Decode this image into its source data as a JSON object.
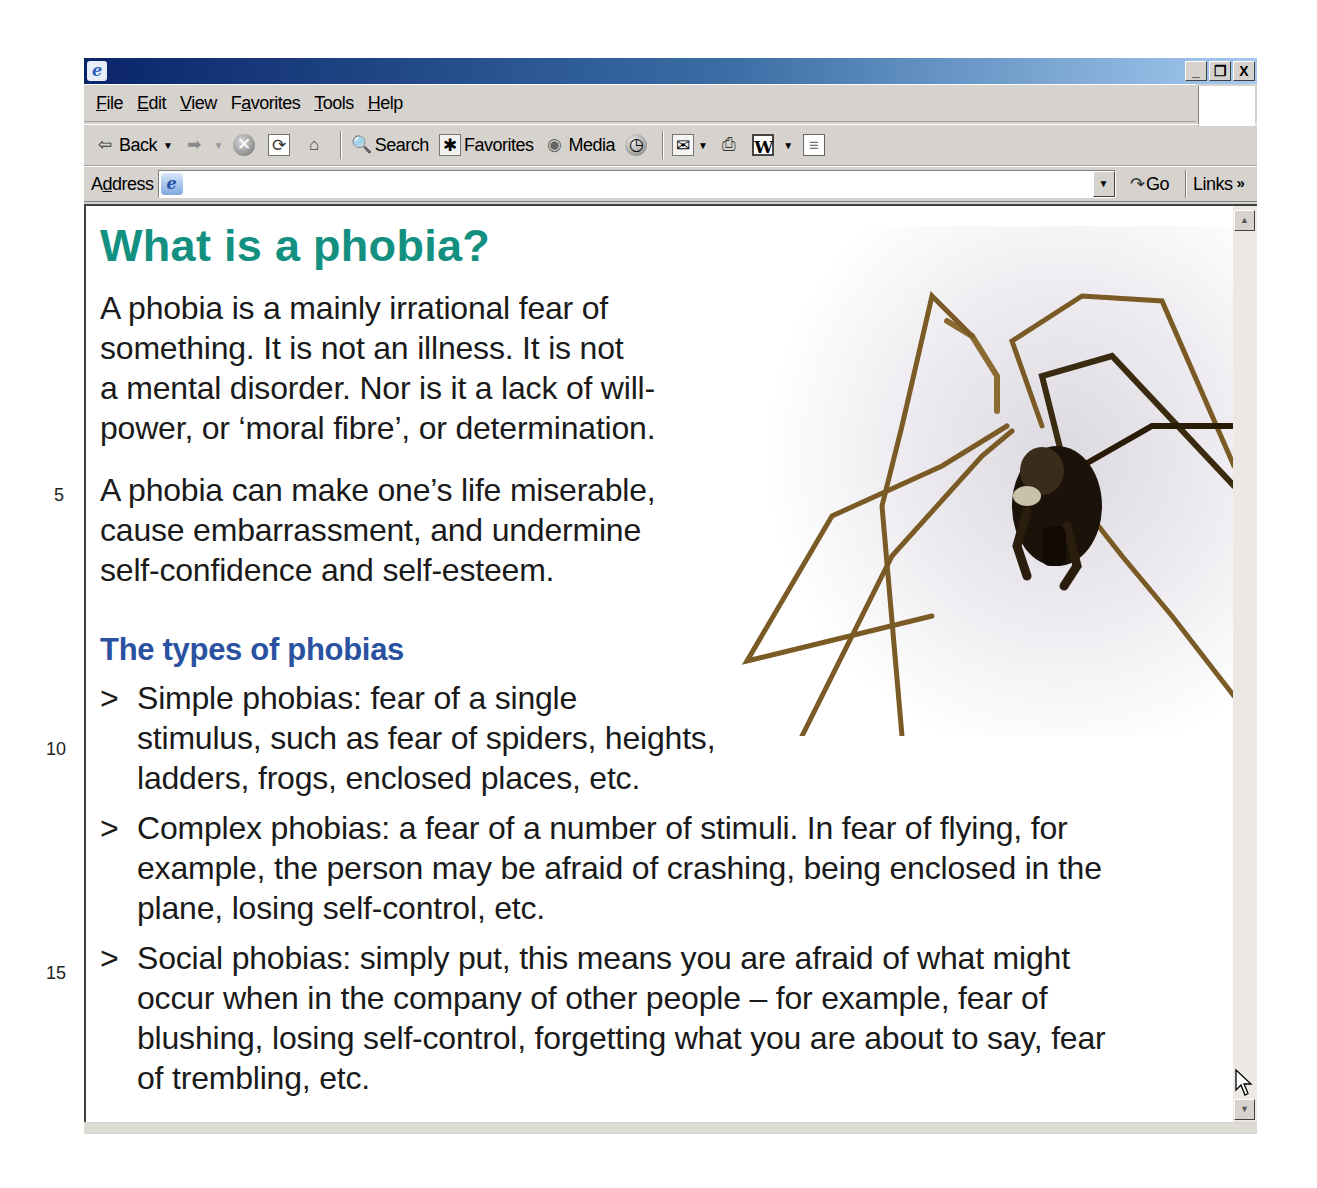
{
  "window": {
    "title": "",
    "controls": {
      "minimize": "_",
      "restore": "❐",
      "close": "X"
    }
  },
  "menubar": {
    "items": [
      {
        "label": "File",
        "accel": "F",
        "rest": "ile"
      },
      {
        "label": "Edit",
        "accel": "E",
        "rest": "dit"
      },
      {
        "label": "View",
        "accel": "V",
        "rest": "iew"
      },
      {
        "label": "Favorites",
        "pre": "F",
        "accel": "a",
        "rest": "vorites"
      },
      {
        "label": "Tools",
        "accel": "T",
        "rest": "ools"
      },
      {
        "label": "Help",
        "accel": "H",
        "rest": "elp"
      }
    ]
  },
  "toolbar": {
    "back_label": "Back",
    "search_label": "Search",
    "favorites_label": "Favorites",
    "media_label": "Media",
    "icons": {
      "back": "⇦",
      "forward": "➡",
      "stop": "✕",
      "refresh": "⟳",
      "home": "⌂",
      "search": "🔍",
      "favorites": "✱",
      "media": "◉",
      "history": "◷",
      "mail": "✉",
      "print": "⎙",
      "edit_word": "W",
      "discuss": "≡",
      "dropdown": "▼"
    }
  },
  "addressbar": {
    "label_pre": "A",
    "label_accel": "d",
    "label_rest": "dress",
    "value": "",
    "go_label": "Go",
    "go_icon": "↷",
    "links_label": "Links",
    "links_chevron": "»",
    "dropdown_icon": "▼"
  },
  "scrollbar": {
    "up_icon": "▲",
    "down_icon": "▼"
  },
  "article": {
    "title": "What is a phobia?",
    "paragraphs": [
      "A phobia is a mainly irrational fear of something. It is not an illness. It is not a mental disorder. Nor is it a lack of will-power, or ‘moral fibre’, or determination.",
      "A phobia can make one’s life miserable, cause embarrassment, and undermine self-confidence and self-esteem."
    ],
    "para1_lines": [
      "A phobia is a mainly irrational fear of",
      "something. It is not an illness. It is not",
      "a mental disorder. Nor is it a lack of will-",
      "power, or ‘moral fibre’, or determination."
    ],
    "para2_lines": [
      "A phobia can make one’s life miserable,",
      "cause embarrassment, and undermine",
      "self-confidence and self-esteem."
    ],
    "subheading": "The types of phobias",
    "bullet_marker": ">",
    "bullets": [
      {
        "lines": [
          "Simple phobias: fear of a single",
          "stimulus, such as fear of spiders, heights,",
          "ladders, frogs, enclosed places, etc."
        ]
      },
      {
        "lines": [
          "Complex phobias: a fear of a number of stimuli. In fear of flying, for",
          "example, the person may be afraid of crashing, being enclosed in the",
          "plane, losing self-control, etc."
        ]
      },
      {
        "lines": [
          "Social phobias: simply put, this means you are afraid of what might",
          "occur when in the company of other people – for example, fear of",
          "blushing, losing self-control, forgetting what you are about to say, fear",
          "of trembling, etc."
        ]
      }
    ],
    "image_alt": "spider"
  },
  "line_numbers": [
    "5",
    "10",
    "15"
  ],
  "colors": {
    "title": "#139080",
    "subheading": "#2a52a0",
    "chrome": "#d6d3ce",
    "titlebar_start": "#0a246a",
    "titlebar_end": "#a6caf0"
  }
}
